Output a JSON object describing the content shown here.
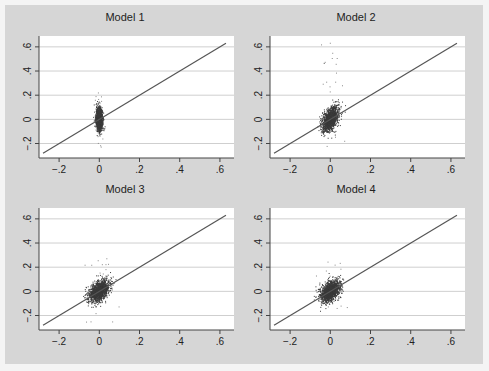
{
  "figure": {
    "background": "#d6d6d6",
    "plot_background": "#ffffff",
    "line_color": "#555555",
    "point_color": "#3a3a3a"
  },
  "chart_data": [
    {
      "type": "scatter",
      "title": "Model 1",
      "xlabel": "",
      "ylabel": "",
      "xlim": [
        -0.3,
        0.67
      ],
      "ylim": [
        -0.32,
        0.69
      ],
      "xticks": [
        "-.2",
        "0",
        ".2",
        ".4",
        ".6"
      ],
      "yticks": [
        "-.2",
        "0",
        ".2",
        ".4",
        ".6"
      ],
      "grid": "horizontal",
      "reference_line": {
        "type": "45-degree",
        "from": [
          -0.28,
          -0.28
        ],
        "to": [
          0.63,
          0.63
        ]
      },
      "cluster": {
        "center": [
          0.0,
          0.0
        ],
        "sd_x": 0.008,
        "sd_y": 0.045,
        "corr": 0.0,
        "outlier_y_range": [
          -0.27,
          0.26
        ]
      }
    },
    {
      "type": "scatter",
      "title": "Model 2",
      "xlabel": "",
      "ylabel": "",
      "xlim": [
        -0.3,
        0.67
      ],
      "ylim": [
        -0.32,
        0.69
      ],
      "xticks": [
        "-.2",
        "0",
        ".2",
        ".4",
        ".6"
      ],
      "yticks": [
        "-.2",
        "0",
        ".2",
        ".4",
        ".6"
      ],
      "grid": "horizontal",
      "reference_line": {
        "type": "45-degree",
        "from": [
          -0.28,
          -0.28
        ],
        "to": [
          0.63,
          0.63
        ]
      },
      "cluster": {
        "center": [
          0.0,
          0.0
        ],
        "sd_x": 0.02,
        "sd_y": 0.05,
        "corr": 0.45,
        "outlier_y_range": [
          -0.27,
          0.63
        ]
      }
    },
    {
      "type": "scatter",
      "title": "Model 3",
      "xlabel": "",
      "ylabel": "",
      "xlim": [
        -0.3,
        0.67
      ],
      "ylim": [
        -0.32,
        0.69
      ],
      "xticks": [
        "-.2",
        "0",
        ".2",
        ".4",
        ".6"
      ],
      "yticks": [
        "-.2",
        "0",
        ".2",
        ".4",
        ".6"
      ],
      "grid": "horizontal",
      "reference_line": {
        "type": "45-degree",
        "from": [
          -0.28,
          -0.28
        ],
        "to": [
          0.63,
          0.63
        ]
      },
      "cluster": {
        "center": [
          0.0,
          0.0
        ],
        "sd_x": 0.025,
        "sd_y": 0.045,
        "corr": 0.45,
        "outlier_y_range": [
          -0.28,
          0.27
        ]
      }
    },
    {
      "type": "scatter",
      "title": "Model 4",
      "xlabel": "",
      "ylabel": "",
      "xlim": [
        -0.3,
        0.67
      ],
      "ylim": [
        -0.32,
        0.69
      ],
      "xticks": [
        "-.2",
        "0",
        ".2",
        ".4",
        ".6"
      ],
      "yticks": [
        "-.2",
        "0",
        ".2",
        ".4",
        ".6"
      ],
      "grid": "horizontal",
      "reference_line": {
        "type": "45-degree",
        "from": [
          -0.28,
          -0.28
        ],
        "to": [
          0.63,
          0.63
        ]
      },
      "cluster": {
        "center": [
          0.0,
          0.0
        ],
        "sd_x": 0.025,
        "sd_y": 0.045,
        "corr": 0.4,
        "outlier_y_range": [
          -0.25,
          0.27
        ]
      }
    }
  ]
}
